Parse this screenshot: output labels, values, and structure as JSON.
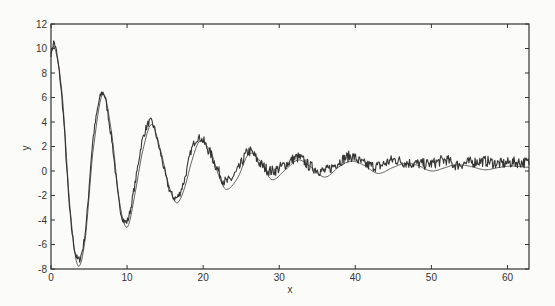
{
  "chart_data": {
    "type": "line",
    "title": "",
    "xlabel": "x",
    "ylabel": "y",
    "xlim": [
      0,
      62.83
    ],
    "ylim": [
      -8,
      12
    ],
    "grid": false,
    "legend": null,
    "x_ticks": [
      0,
      10,
      20,
      30,
      40,
      50,
      60
    ],
    "y_ticks": [
      -8,
      -6,
      -4,
      -2,
      0,
      2,
      4,
      6,
      8,
      10,
      12
    ],
    "series": [
      {
        "name": "model (smooth damped cosine)",
        "style": "thin line",
        "x": [
          0,
          0.5,
          1.5,
          2.5,
          3.5,
          4.5,
          5.5,
          6.8,
          8,
          9,
          10,
          11,
          12,
          13.2,
          14.5,
          15.5,
          16.5,
          17.5,
          18.5,
          19.5,
          21,
          22,
          23,
          24.5,
          26,
          27.5,
          29,
          31,
          32.5,
          34,
          36,
          38,
          39.5,
          41,
          43,
          45,
          46.5,
          48,
          50,
          52,
          53,
          55,
          57,
          59,
          60.5,
          62.8
        ],
        "y": [
          9.6,
          10.0,
          6.0,
          -3.0,
          -7.7,
          -5.5,
          1.5,
          6.3,
          3.0,
          -2.5,
          -4.6,
          -2.0,
          1.5,
          3.8,
          1.5,
          -1.2,
          -2.6,
          -1.5,
          0.8,
          2.4,
          1.6,
          -0.3,
          -1.5,
          -0.6,
          1.4,
          0.8,
          -0.7,
          0.2,
          0.9,
          0.4,
          -0.5,
          0.4,
          0.8,
          0.5,
          -0.2,
          0.3,
          0.6,
          0.5,
          0.0,
          0.3,
          0.5,
          0.4,
          0.1,
          0.3,
          0.4,
          0.3
        ]
      },
      {
        "name": "measured (noisy)",
        "style": "thick noisy line",
        "x": [
          0,
          0.5,
          1.5,
          2.5,
          3.5,
          4.5,
          5.5,
          6.8,
          8,
          9,
          10,
          11,
          12,
          13.2,
          14.5,
          15.5,
          16.5,
          17.5,
          18.5,
          19.5,
          21,
          22,
          23,
          24.5,
          26,
          27.5,
          29,
          31,
          32.5,
          34,
          36,
          38,
          39.5,
          41,
          43,
          45,
          46.5,
          48,
          50,
          52,
          53,
          55,
          57,
          59,
          60.5,
          62.8
        ],
        "y": [
          9.6,
          10.3,
          5.5,
          -3.5,
          -7.2,
          -5.0,
          2.5,
          6.4,
          2.5,
          -2.8,
          -4.1,
          -1.2,
          2.5,
          4.0,
          1.2,
          -1.4,
          -2.2,
          -0.8,
          1.8,
          2.7,
          1.4,
          0.0,
          -0.9,
          0.0,
          1.6,
          0.6,
          0.0,
          0.6,
          1.1,
          0.4,
          0.0,
          0.8,
          1.2,
          0.6,
          0.4,
          0.9,
          0.7,
          0.6,
          0.6,
          0.9,
          0.5,
          0.7,
          0.8,
          0.6,
          0.7,
          0.7
        ]
      }
    ]
  },
  "plot": {
    "xlabel": "x",
    "ylabel": "y",
    "x_tick_labels": [
      "0",
      "10",
      "20",
      "30",
      "40",
      "50",
      "60"
    ],
    "y_tick_labels": [
      "-8",
      "-6",
      "-4",
      "-2",
      "0",
      "2",
      "4",
      "6",
      "8",
      "10",
      "12"
    ],
    "colors": {
      "axis": "#333333",
      "line": "#2a2a2a",
      "background": "#fbfbfa"
    }
  }
}
